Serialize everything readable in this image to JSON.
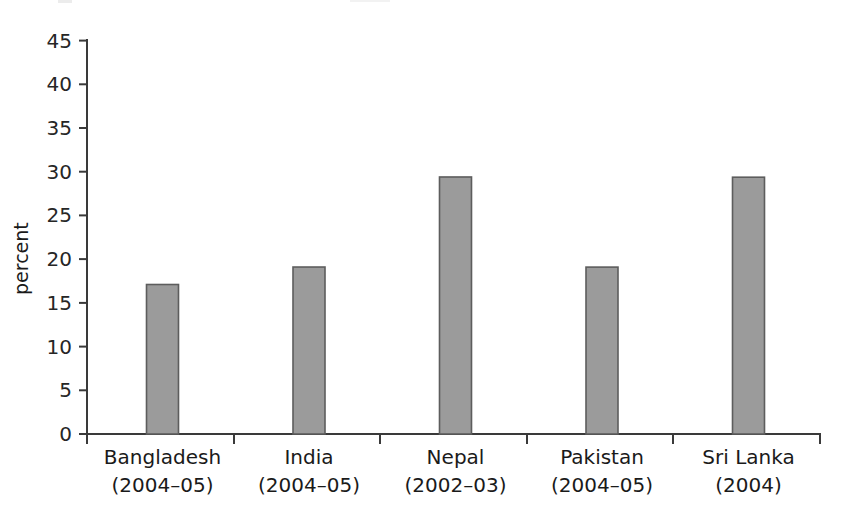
{
  "chart_data": {
    "type": "bar",
    "title": "",
    "subtitle": "",
    "xlabel": "",
    "ylabel": "percent",
    "ylim": [
      0,
      45
    ],
    "ytick_step": 5,
    "yticks": [
      "0",
      "5",
      "10",
      "15",
      "20",
      "25",
      "30",
      "35",
      "40",
      "45"
    ],
    "grid": false,
    "legend": false,
    "categories": [
      "Bangladesh",
      "India",
      "Nepal",
      "Pakistan",
      "Sri Lanka"
    ],
    "category_years": [
      "(2004–05)",
      "(2004–05)",
      "(2002–03)",
      "(2004–05)",
      "(2004)"
    ],
    "values": [
      32.3,
      40.6,
      17.1,
      19.1,
      29.4
    ],
    "bar_color": "#9b9b9b",
    "bar_edge_color": "#5d5d5d",
    "axis_color": "#3a3a3a",
    "background_color": "#ffffff"
  },
  "axis": {
    "y_title": "percent"
  }
}
